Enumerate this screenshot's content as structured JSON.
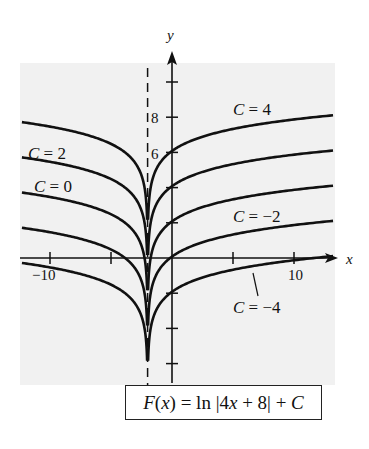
{
  "chart_data": {
    "type": "line",
    "title": "",
    "formula": {
      "prefix_italic": "F",
      "prefix_rest": "(",
      "var": "x",
      "mid": ") = ln |4",
      "var2": "x",
      "tail": " + 8| + ",
      "const": "C",
      "full": "F(x) = ln |4x + 8| + C"
    },
    "xlabel": "x",
    "ylabel": "y",
    "function": "ln|4x+8| + C",
    "asymptote_x": -2,
    "xlim": [
      -12.3,
      13.2
    ],
    "ylim": [
      -7,
      10
    ],
    "x_ticks": [
      -10,
      -5,
      5,
      10
    ],
    "x_tick_labels": [
      {
        "value": -10,
        "label": "−10"
      },
      {
        "value": 10,
        "label": "10"
      }
    ],
    "y_ticks": [
      -6,
      -4,
      -2,
      2,
      4,
      6,
      8,
      10
    ],
    "y_tick_labels": [
      {
        "value": 8,
        "label": "8"
      },
      {
        "value": 6,
        "label": "6"
      }
    ],
    "grid": false,
    "series": [
      {
        "name": "C = 4",
        "C": 4
      },
      {
        "name": "C = 2",
        "C": 2
      },
      {
        "name": "C = 0",
        "C": 0
      },
      {
        "name": "C = -2",
        "C": -2
      },
      {
        "name": "C = -4",
        "C": -4
      }
    ],
    "annotations": [
      {
        "text": "C = 4",
        "x_px": 233,
        "y_px": 115
      },
      {
        "text": "C = 2",
        "x_px": 28,
        "y_px": 158
      },
      {
        "text": "C = 0",
        "x_px": 28,
        "y_px": 192
      },
      {
        "text": "C = −2",
        "x_px": 233,
        "y_px": 222
      },
      {
        "text": "C = −4",
        "x_px": 233,
        "y_px": 312
      }
    ],
    "colors": {
      "curve": "#111111",
      "panel": "#f1f1f1",
      "axis": "#111111"
    }
  },
  "labels": {
    "x_axis": "x",
    "y_axis": "y",
    "tick_neg10": "−10",
    "tick_10": "10",
    "tick_8": "8",
    "tick_6": "6",
    "c4": "C = 4",
    "c2": "C = 2",
    "c0": "C = 0",
    "cm2": "C = −2",
    "cm4": "C = −4"
  }
}
